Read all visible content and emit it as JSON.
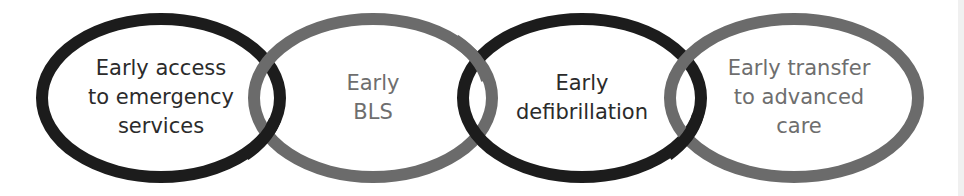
{
  "diagram": {
    "links": [
      {
        "id": "link-1",
        "lines": [
          "Early access",
          "to emergency",
          "services"
        ],
        "ring_color": "#1c1c1c",
        "text_color": "#2b2b2b"
      },
      {
        "id": "link-2",
        "lines": [
          "Early",
          "BLS"
        ],
        "ring_color": "#6b6b6b",
        "text_color": "#6e6e6e"
      },
      {
        "id": "link-3",
        "lines": [
          "Early",
          "defibrillation"
        ],
        "ring_color": "#1c1c1c",
        "text_color": "#2b2b2b"
      },
      {
        "id": "link-4",
        "lines": [
          "Early transfer",
          "to advanced",
          "care"
        ],
        "ring_color": "#6b6b6b",
        "text_color": "#6e6e6e"
      }
    ]
  }
}
